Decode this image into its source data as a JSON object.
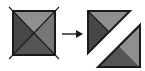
{
  "figure": {
    "background_color": "#ffffff",
    "arrow": {
      "icon": "right-arrow-icon",
      "label": "→",
      "color": "#1a1a1a",
      "x1": 62,
      "y1": 34,
      "x2": 82,
      "y2": 34
    },
    "left_shape": {
      "name": "source-square",
      "description": "Square divided by both diagonals into four triangles",
      "x": 13,
      "y": 11,
      "width": 42,
      "height": 44,
      "outline_color": "#1a1a1a",
      "pieces": [
        {
          "name": "top-triangle",
          "fill": "#8f8f8f",
          "points": "13,11 55,11 34,33"
        },
        {
          "name": "left-triangle",
          "fill": "#474747",
          "points": "13,11 34,33 13,55"
        },
        {
          "name": "right-triangle",
          "fill": "#767676",
          "points": "55,11 55,55 34,33"
        },
        {
          "name": "bottom-triangle",
          "fill": "#555555",
          "points": "13,55 55,55 34,33"
        }
      ],
      "cut_lines": [
        {
          "name": "cut-line-nw-se",
          "x1": 9,
          "y1": 7,
          "x2": 59,
          "y2": 59
        },
        {
          "name": "cut-line-ne-sw",
          "x1": 59,
          "y1": 7,
          "x2": 9,
          "y2": 59
        }
      ]
    },
    "right_shape": {
      "name": "result-figure",
      "description": "Two right triangles arranged point to point forming a Z shape",
      "x": 88,
      "y": 11,
      "width": 52,
      "height": 56,
      "outline_color": "#1a1a1a",
      "upper_triangle": {
        "name": "upper-right-triangle",
        "outline": "88,11 130,11 88,53",
        "pieces": [
          {
            "name": "upper-top-piece",
            "fill": "#8f8f8f",
            "points": "88,11 130,11 109,32"
          },
          {
            "name": "upper-left-piece",
            "fill": "#474747",
            "points": "88,11 109,32 88,53"
          }
        ]
      },
      "lower_triangle": {
        "name": "lower-left-triangle",
        "outline": "98,67 140,67 140,25",
        "pieces": [
          {
            "name": "lower-right-piece",
            "fill": "#8f8f8f",
            "points": "140,25 140,67 119,46"
          },
          {
            "name": "lower-bottom-piece",
            "fill": "#555555",
            "points": "98,67 140,67 119,46"
          }
        ]
      }
    },
    "palette": {
      "light_gray": "#8f8f8f",
      "medium_gray": "#767676",
      "mid_dark_gray": "#555555",
      "dark_gray": "#474747",
      "outline": "#1a1a1a",
      "background": "#ffffff"
    }
  }
}
